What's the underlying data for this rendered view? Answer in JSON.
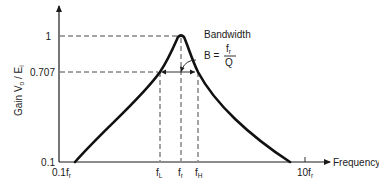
{
  "diagram": {
    "y_axis": {
      "label_main": "Gain V",
      "label_sub_o": "o",
      "label_sep": " / E",
      "label_sub_i": "i",
      "ticks": [
        "1",
        "0.707",
        "0.1"
      ]
    },
    "x_axis": {
      "label": "Frequency",
      "ticks": [
        {
          "main": "0.1f",
          "sub": "r"
        },
        {
          "main": "f",
          "sub": "L"
        },
        {
          "main": "f",
          "sub": "r"
        },
        {
          "main": "f",
          "sub": "H"
        },
        {
          "main": "10f",
          "sub": "r"
        }
      ]
    },
    "annotation": {
      "title": "Bandwidth",
      "formula_lhs": "B =",
      "numerator_main": "f",
      "numerator_sub": "r",
      "denominator": "Q"
    }
  }
}
